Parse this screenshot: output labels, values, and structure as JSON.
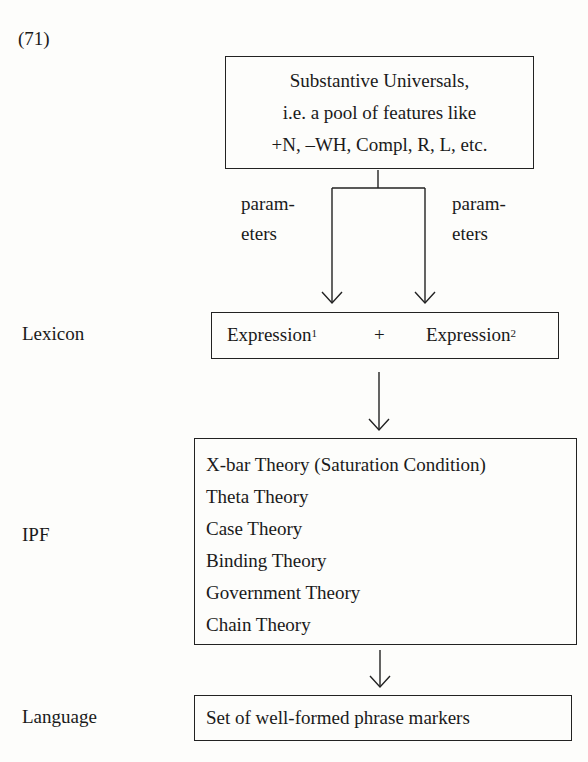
{
  "example_number": "(71)",
  "source_box": {
    "lines": [
      "Substantive Universals,",
      "i.e. a pool of features like",
      "+N, –WH, Compl, R, L, etc."
    ]
  },
  "branch_labels": {
    "left": [
      "param-",
      "eters"
    ],
    "right": [
      "param-",
      "eters"
    ]
  },
  "levels": {
    "lexicon": "Lexicon",
    "ipf": "IPF",
    "language": "Language"
  },
  "lexicon_box": {
    "expr1": "Expression",
    "expr1_sup": "1",
    "plus": "+",
    "expr2": "Expression",
    "expr2_sup": "2"
  },
  "ipf_box": {
    "items": [
      "X-bar Theory (Saturation Condition)",
      "Theta Theory",
      "Case Theory",
      "Binding Theory",
      "Government Theory",
      "Chain Theory"
    ]
  },
  "language_box": {
    "text": "Set of well-formed phrase markers"
  }
}
